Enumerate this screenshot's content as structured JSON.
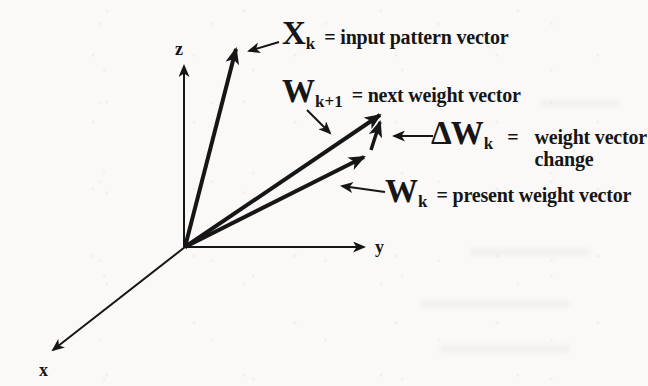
{
  "figure": {
    "type": "vector-diagram",
    "axes": {
      "x": "x",
      "y": "y",
      "z": "z"
    },
    "vectors": [
      {
        "id": "xk",
        "symbol": "X",
        "subscript": "k",
        "description": "= input pattern vector"
      },
      {
        "id": "wk1",
        "symbol": "W",
        "subscript": "k+1",
        "description": "= next weight vector"
      },
      {
        "id": "dwk",
        "symbol": "ΔW",
        "subscript": "k",
        "eq": "=",
        "description_line1": "weight vector",
        "description_line2": "change"
      },
      {
        "id": "wk",
        "symbol": "W",
        "subscript": "k",
        "description": "= present weight vector"
      }
    ],
    "colors": {
      "ink": "#161616",
      "paper": "#faf9f7"
    }
  }
}
